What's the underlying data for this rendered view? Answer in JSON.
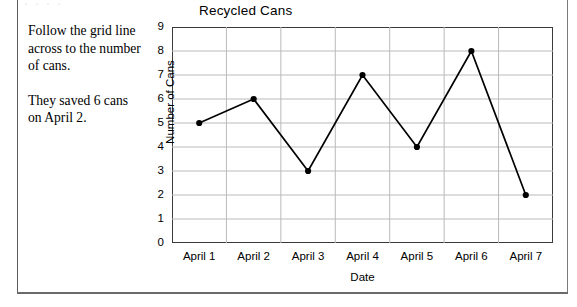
{
  "worksheet": {
    "scan_artifact_text": "·   ·  ·  ·",
    "instructions": [
      "Follow the grid line across to the number of cans.",
      "They saved 6 cans on April 2."
    ]
  },
  "chart_data": {
    "type": "line",
    "title": "Recycled Cans",
    "xlabel": "Date",
    "ylabel": "Number of Cans",
    "categories": [
      "April 1",
      "April 2",
      "April 3",
      "April 4",
      "April 5",
      "April 6",
      "April 7"
    ],
    "values": [
      5,
      6,
      3,
      7,
      4,
      8,
      2
    ],
    "ylim": [
      0,
      9
    ],
    "yticks": [
      0,
      1,
      2,
      3,
      4,
      5,
      6,
      7,
      8,
      9
    ],
    "grid": true,
    "legend": false,
    "series_color": "#000000",
    "grid_color": "#b9b9b9",
    "frame_color": "#3a3a3a",
    "marker": "circle"
  }
}
